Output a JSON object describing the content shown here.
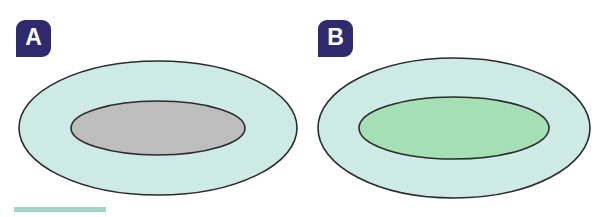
{
  "figure": {
    "type": "two-panel-diagram",
    "background_color": "#ffffff",
    "width": 608,
    "height": 217,
    "outline_color": "#2b2b2b",
    "badge_color": "#2f2a6e",
    "badge_text_color": "#ffffff",
    "accent_bar_color": "#9fd8cb"
  },
  "panels": [
    {
      "id": "panel-a",
      "label": "A",
      "outer_ellipse": {
        "name": "outer-ellipse",
        "fill": "#cdeae4",
        "cx": 158,
        "cy": 128,
        "rx": 139,
        "ry": 67
      },
      "inner_ellipse": {
        "name": "inner-ellipse",
        "fill": "#bdbdbd",
        "cx": 158,
        "cy": 128,
        "rx": 87,
        "ry": 27
      }
    },
    {
      "id": "panel-b",
      "label": "B",
      "outer_ellipse": {
        "name": "outer-ellipse",
        "fill": "#cdeae4",
        "cx": 150,
        "cy": 128,
        "rx": 136,
        "ry": 70
      },
      "inner_ellipse": {
        "name": "inner-ellipse",
        "fill": "#a5dfb5",
        "cx": 150,
        "cy": 128,
        "rx": 95,
        "ry": 31
      }
    }
  ]
}
